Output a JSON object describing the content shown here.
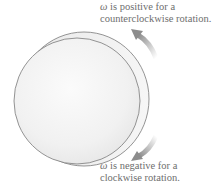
{
  "labels": {
    "top": {
      "symbol": "ω",
      "line1_rest": " is positive for a",
      "line2": "counterclockwise rotation."
    },
    "bottom": {
      "symbol": "ω",
      "line1_rest": " is negative for a",
      "line2": "clockwise rotation."
    }
  },
  "figure": {
    "object": "rotating disk",
    "arrows": [
      "counterclockwise-arrow",
      "clockwise-arrow"
    ],
    "colors": {
      "disk_face": "#f2f2f2",
      "disk_edge": "#7a7a7a",
      "arrow": "#8c8c8c",
      "text": "#6e6e6e"
    }
  }
}
